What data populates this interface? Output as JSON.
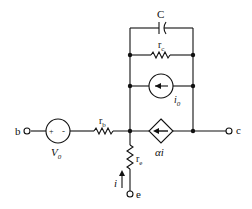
{
  "diagram": {
    "type": "circuit",
    "labels": {
      "capacitor": "C",
      "rc_main": "r",
      "rc_sub": "c",
      "i0_main": "i",
      "i0_sub": "0",
      "rb_main": "r",
      "rb_sub": "b",
      "re_main": "r",
      "re_sub": "e",
      "v0_main": "V",
      "v0_sub": "0",
      "dep_source": "αi",
      "current": "i",
      "term_b": "b",
      "term_c": "c",
      "term_e": "e",
      "plus": "+",
      "minus": "-"
    },
    "components": [
      {
        "id": "C",
        "kind": "capacitor"
      },
      {
        "id": "rc",
        "kind": "resistor"
      },
      {
        "id": "i0",
        "kind": "current-source"
      },
      {
        "id": "V0",
        "kind": "voltage-source"
      },
      {
        "id": "rb",
        "kind": "resistor"
      },
      {
        "id": "re",
        "kind": "resistor"
      },
      {
        "id": "alpha_i",
        "kind": "dependent-current-source"
      }
    ],
    "terminals": [
      "b",
      "c",
      "e"
    ]
  }
}
